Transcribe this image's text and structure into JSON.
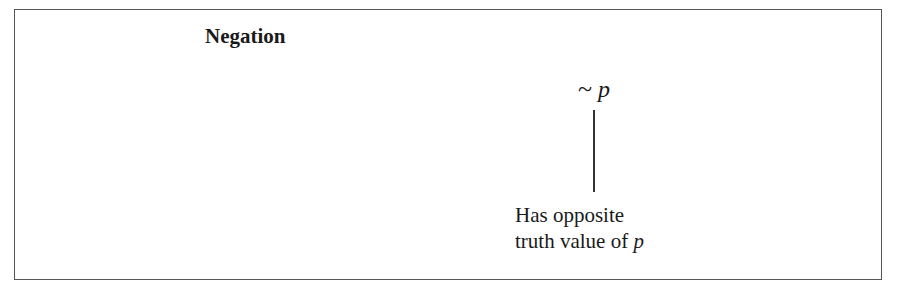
{
  "diagram": {
    "title": "Negation",
    "expression": {
      "operator": "~",
      "variable": "p"
    },
    "annotation": {
      "line1": "Has opposite",
      "line2_prefix": "truth value of ",
      "line2_variable": "p"
    }
  }
}
